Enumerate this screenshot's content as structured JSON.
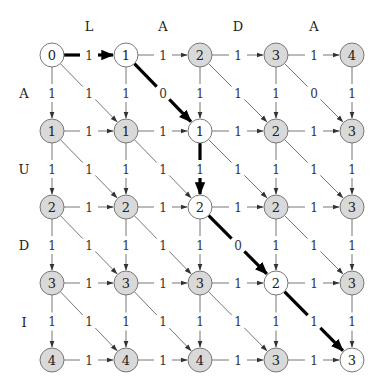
{
  "colors": {
    "node_gray_fill": "#d9d9d9",
    "node_white_fill": "#ffffff",
    "node_stroke": "#777777",
    "edge": "#666666",
    "path": "#000000"
  },
  "column_letters": [
    "L",
    "A",
    "D",
    "A"
  ],
  "row_letters": [
    "A",
    "U",
    "D",
    "I"
  ],
  "grid": [
    [
      0,
      1,
      2,
      3,
      4
    ],
    [
      1,
      1,
      1,
      2,
      3
    ],
    [
      2,
      2,
      2,
      2,
      3
    ],
    [
      3,
      3,
      3,
      2,
      3
    ],
    [
      4,
      4,
      4,
      3,
      3
    ]
  ],
  "on_path": [
    [
      true,
      true,
      false,
      false,
      false
    ],
    [
      false,
      false,
      true,
      false,
      false
    ],
    [
      false,
      false,
      true,
      false,
      false
    ],
    [
      false,
      false,
      false,
      true,
      false
    ],
    [
      false,
      false,
      false,
      false,
      true
    ]
  ],
  "horizontal_weight": "1",
  "vertical_weight": "1",
  "diagonal_weights": [
    [
      "1",
      "0",
      "1",
      "0"
    ],
    [
      "1",
      "1",
      "1",
      "1"
    ],
    [
      "1",
      "1",
      "0",
      "1"
    ],
    [
      "1",
      "1",
      "1",
      "1"
    ]
  ],
  "path_edges": [
    {
      "from": [
        0,
        0
      ],
      "to": [
        0,
        1
      ]
    },
    {
      "from": [
        0,
        1
      ],
      "to": [
        1,
        2
      ]
    },
    {
      "from": [
        1,
        2
      ],
      "to": [
        2,
        2
      ]
    },
    {
      "from": [
        2,
        2
      ],
      "to": [
        3,
        3
      ]
    },
    {
      "from": [
        3,
        3
      ],
      "to": [
        4,
        4
      ]
    }
  ]
}
